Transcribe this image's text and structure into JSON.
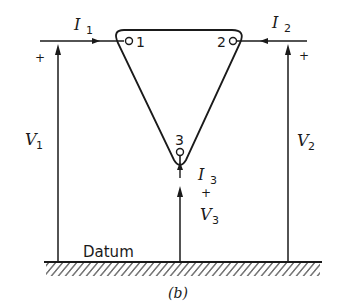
{
  "diagram": {
    "type": "three-terminal network with datum",
    "caption": "(b)",
    "ground_label": "Datum",
    "nodes": [
      {
        "id": "1",
        "label": "1"
      },
      {
        "id": "2",
        "label": "2"
      },
      {
        "id": "3",
        "label": "3"
      }
    ],
    "currents": [
      {
        "name": "I",
        "sub": "1",
        "direction": "into node 1 (rightward)"
      },
      {
        "name": "I",
        "sub": "2",
        "direction": "into node 2 (leftward)"
      },
      {
        "name": "I",
        "sub": "3",
        "direction": "into node 3 (upward)"
      }
    ],
    "voltages": [
      {
        "name": "V",
        "sub": "1",
        "polarity": "+"
      },
      {
        "name": "V",
        "sub": "2",
        "polarity": "+"
      },
      {
        "name": "V",
        "sub": "3",
        "polarity": "+"
      }
    ],
    "colors": {
      "ink": "#1a1a1a",
      "background": "#ffffff"
    }
  }
}
